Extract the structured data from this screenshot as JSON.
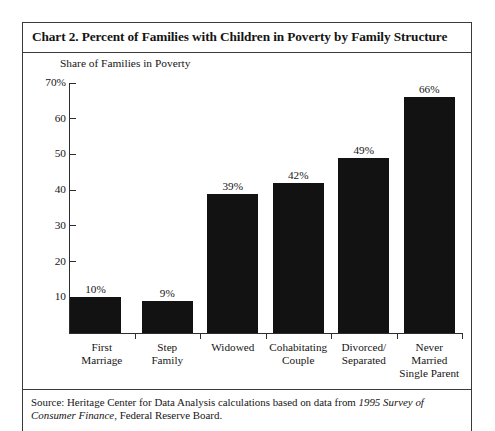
{
  "header": {
    "title": "Chart 2. Percent of Families with Children in Poverty by Family Structure"
  },
  "footer": {
    "source_prefix": "Source: Heritage Center for Data Analysis calculations based on data from ",
    "source_italic": "1995 Survey of Consumer Finance",
    "source_suffix": ", Federal Reserve Board."
  },
  "chart_data": {
    "type": "bar",
    "title": "Chart 2. Percent of Families with Children in Poverty by Family Structure",
    "subtitle": "Share of Families in Poverty",
    "xlabel": "",
    "ylabel": "Share of Families in Poverty",
    "ylim": [
      0,
      70
    ],
    "grid": false,
    "legend": false,
    "bar_color": "#121212",
    "axis_color": "#2e2e2e",
    "categories": [
      "First\nMarriage",
      "Step\nFamily",
      "Widowed",
      "Cohabitating\nCouple",
      "Divorced/\nSeparated",
      "Never\nMarried\nSingle Parent"
    ],
    "category_lines": [
      [
        "First",
        "Marriage"
      ],
      [
        "Step",
        "Family"
      ],
      [
        "Widowed"
      ],
      [
        "Cohabitating",
        "Couple"
      ],
      [
        "Divorced/",
        "Separated"
      ],
      [
        "Never",
        "Married",
        "Single Parent"
      ]
    ],
    "values": [
      10,
      9,
      39,
      42,
      49,
      66
    ],
    "data_labels": [
      "10%",
      "9%",
      "39%",
      "42%",
      "49%",
      "66%"
    ],
    "yticks": [
      70,
      60,
      50,
      40,
      30,
      20,
      10
    ],
    "ytick_labels": [
      "70%",
      "60",
      "50",
      "40",
      "30",
      "20",
      "10"
    ]
  }
}
